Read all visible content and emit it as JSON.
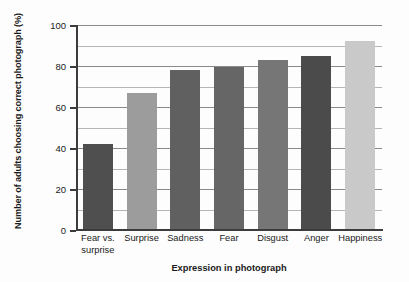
{
  "chart_data": {
    "type": "bar",
    "title": "",
    "xlabel": "Expression in photograph",
    "ylabel": "Number of adults choosing correct photograph (%)",
    "categories": [
      "Fear vs. surprise",
      "Surprise",
      "Sadness",
      "Fear",
      "Disgust",
      "Anger",
      "Happiness"
    ],
    "category_lines": [
      [
        "Fear vs.",
        "surprise"
      ],
      [
        "Surprise"
      ],
      [
        "Sadness"
      ],
      [
        "Fear"
      ],
      [
        "Disgust"
      ],
      [
        "Anger"
      ],
      [
        "Happiness"
      ]
    ],
    "values": [
      42,
      67,
      78,
      79.5,
      83,
      85,
      92
    ],
    "bar_colors": [
      "#4f4f4f",
      "#9c9c9c",
      "#606060",
      "#666666",
      "#767676",
      "#4b4b4b",
      "#c9c9c9"
    ],
    "ylim": [
      0,
      100
    ],
    "ytick_labels": [
      "0",
      "20",
      "40",
      "60",
      "80",
      "100"
    ],
    "ytick_values": [
      0,
      20,
      40,
      60,
      80,
      100
    ],
    "gridline_values": [
      10,
      20,
      30,
      40,
      50,
      60,
      70,
      80,
      90,
      100
    ],
    "major_gridline_values": [
      20,
      40,
      60,
      80,
      100
    ],
    "grid": true,
    "legend": "none"
  }
}
